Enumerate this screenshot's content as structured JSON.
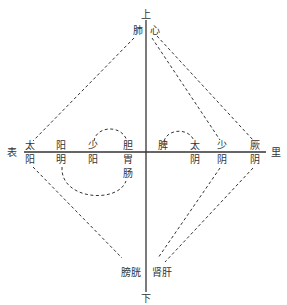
{
  "diagram": {
    "axis_labels": {
      "top": "上",
      "bottom": "下",
      "left": "表",
      "right": "里"
    },
    "top_organs": {
      "left": "肺",
      "right": "心"
    },
    "bottom_organs": {
      "left": "膀胱",
      "right": "肾肝"
    },
    "yang_channels": [
      {
        "top": "太",
        "bottom": "阳"
      },
      {
        "top": "阳",
        "bottom": "明"
      },
      {
        "top": "少",
        "bottom": "阳"
      },
      {
        "top": "胆",
        "bottom": "胃",
        "extra": "肠"
      }
    ],
    "yin_channels": [
      {
        "top": "脾",
        "bottom": ""
      },
      {
        "top": "太",
        "bottom": "阴"
      },
      {
        "top": "少",
        "bottom": "阴"
      },
      {
        "top": "厥",
        "bottom": "阴"
      }
    ],
    "colors": {
      "line": "#333333",
      "text": "#333333",
      "background": "#ffffff"
    }
  }
}
